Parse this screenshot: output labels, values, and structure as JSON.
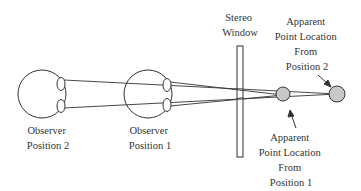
{
  "diagram": {
    "labels": {
      "observer2": [
        "Observer",
        "Position 2"
      ],
      "observer1": [
        "Observer",
        "Position 1"
      ],
      "window": [
        "Stereo",
        "Window"
      ],
      "point2": [
        "Apparent",
        "Point Location",
        "From",
        "Position 2"
      ],
      "point1": [
        "Apparent",
        "Point Location",
        "From",
        "Position 1"
      ]
    },
    "colors": {
      "stroke": "#333333",
      "point_fill": "#c8c8c8",
      "background": "#ffffff"
    }
  }
}
